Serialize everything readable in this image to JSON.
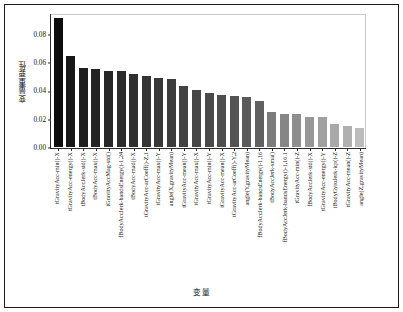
{
  "chart_data": {
    "type": "bar",
    "title": "",
    "xlabel": "变量",
    "ylabel": "变量重要性",
    "ylim": [
      0.0,
      0.095
    ],
    "yticks": [
      "0.00",
      "0.02",
      "0.04",
      "0.06",
      "0.08"
    ],
    "ytick_values": [
      0.0,
      0.02,
      0.04,
      0.06,
      0.08
    ],
    "grid": false,
    "legend": "none",
    "bar_colors": [
      "#0d0d0d",
      "#171717",
      "#1f1f1f",
      "#232323",
      "#272727",
      "#2b2b2b",
      "#303030",
      "#343434",
      "#383838",
      "#3c3c3c",
      "#424242",
      "#464646",
      "#4a4a4a",
      "#4f4f4f",
      "#545454",
      "#5a5a5a",
      "#606060",
      "#7c7c7c",
      "#868686",
      "#8e8e8e",
      "#979797",
      "#9f9f9f",
      "#a9a9a9",
      "#b0b0b0",
      "#bcbcbc"
    ],
    "categories": [
      "tGravityAcc-min()-X",
      "tGravityAcc-energy()-X",
      "tBodyAccJerk-std()-X",
      "tBodyAcc-max()-X",
      "tGravityAccMag-std()",
      "fBodyAccJerk-bandsEnergy()-1,24",
      "tBodyAcc-mad()-X",
      "tGravityAcc-arCoeff()-Z,1",
      "tGravityAcc-max()-Y",
      "angle(X,gravityMean)",
      "tGravityAcc-mean()-Y",
      "tGravityAcc-max()-X",
      "tGravityAcc-min()-Y",
      "tGravityAcc-mean()-X",
      "tGravityAcc-arCoeff()-Y,2",
      "angle(Y,gravityMean)",
      "fBodyAccJerk-bandsEnergy()-1,16",
      "tBodyAccJerk-sma()",
      "fBodyAccJerk-bandsEnergy()-1,16.1",
      "tGravityAcc-min()-Z",
      "fBodyAccJerk-std()-X",
      "tGravityAcc-energy()-Y",
      "tBodyGyroJerk-iqr()-Z",
      "tGravityAcc-mean()-Z",
      "angle(Z,gravityMean)"
    ],
    "values": [
      0.092,
      0.0651,
      0.0563,
      0.056,
      0.0546,
      0.0545,
      0.0521,
      0.0505,
      0.0495,
      0.0484,
      0.0437,
      0.0408,
      0.0386,
      0.0373,
      0.0364,
      0.0354,
      0.0329,
      0.0248,
      0.0239,
      0.0235,
      0.0217,
      0.0216,
      0.0167,
      0.0153,
      0.0137
    ]
  }
}
